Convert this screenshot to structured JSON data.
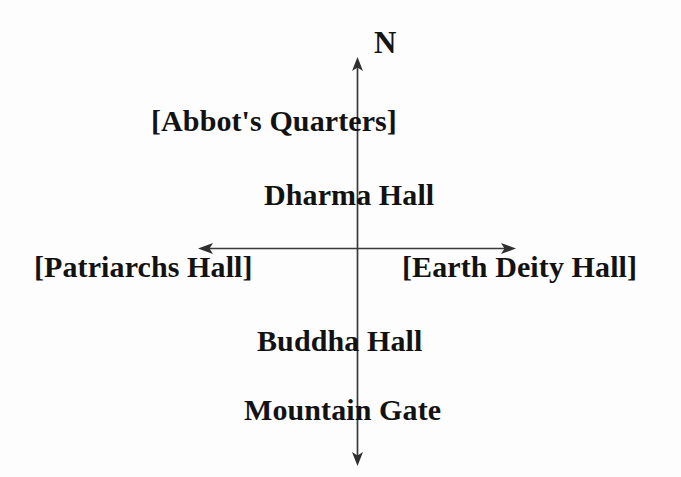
{
  "diagram": {
    "background_color": "#fdfdfd",
    "line_color": "#3a3a3a",
    "text_color": "#121212",
    "compass": {
      "north_label": "N",
      "icon_name": "compass-north-arrow"
    },
    "axes": {
      "vertical": {
        "name": "north-south-axis",
        "x": 357,
        "y_top": 57,
        "y_bottom": 466,
        "arrowheads": [
          "top",
          "bottom"
        ]
      },
      "horizontal": {
        "name": "east-west-axis",
        "y": 248,
        "x_left": 198,
        "x_right": 516,
        "arrowheads": [
          "left",
          "right"
        ]
      }
    },
    "labels": [
      {
        "id": "abbots-quarters",
        "text": "[Abbot's Quarters]",
        "position": "north-outer",
        "bracketed": true
      },
      {
        "id": "dharma-hall",
        "text": "Dharma Hall",
        "position": "north-inner",
        "bracketed": false
      },
      {
        "id": "patriarchs-hall",
        "text": "[Patriarchs Hall]",
        "position": "west",
        "bracketed": true
      },
      {
        "id": "earth-deity-hall",
        "text": "[Earth Deity Hall]",
        "position": "east",
        "bracketed": true
      },
      {
        "id": "buddha-hall",
        "text": "Buddha Hall",
        "position": "south-inner",
        "bracketed": false
      },
      {
        "id": "mountain-gate",
        "text": "Mountain Gate",
        "position": "south-outer",
        "bracketed": false
      }
    ]
  }
}
